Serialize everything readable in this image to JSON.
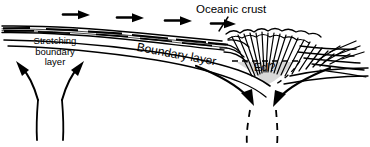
{
  "diagram": {
    "background_color": "#ffffff",
    "ink_color": "#000000",
    "shade_color": "#d8d8d8",
    "width": 370,
    "height": 147,
    "labels": {
      "oceanic_crust": "Oceanic crust",
      "stretching_boundary_layer": "Stretching\nboundary\nlayer",
      "stretching_boundary_layer_line1": "Stretching",
      "stretching_boundary_layer_line2": "boundary",
      "stretching_boundary_layer_line3": "layer",
      "boundary_layer": "Boundary layer",
      "eclogite": "Ecl?"
    },
    "features": {
      "surface_flow_arrows": {
        "name": "surface-flow-arrows",
        "count": 4,
        "direction": "right",
        "description": "Horizontal arrows along the top surface indicating rightward plate motion"
      },
      "upwelling_arrows": {
        "name": "upwelling-arrows",
        "count": 2,
        "direction": "divergent-upward",
        "description": "Two curved arrows diverging upward beneath the stretching boundary layer"
      },
      "downwelling_arrows": {
        "name": "downwelling-arrows",
        "count": 2,
        "direction": "convergent-downward",
        "description": "Two curved arrows converging downward into the subduction zone"
      },
      "fan_pattern": {
        "name": "deformation-fan",
        "line_count": 34,
        "description": "Radial fan of short lines representing deformed/thickened crust above the downwelling"
      },
      "dashed_trails": {
        "name": "dashed-flow-trails",
        "count": 4,
        "description": "Dashed curves continuing the flow lines below the arrows and outlining the eclogite zone"
      },
      "eclogite_zone": {
        "name": "eclogite-zone",
        "shape": "triangular",
        "shaded": true
      }
    }
  }
}
